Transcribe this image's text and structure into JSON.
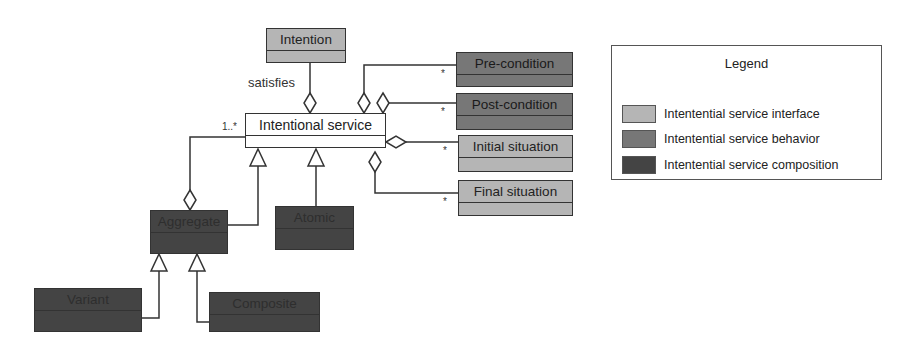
{
  "colors": {
    "interface": "#b5b5b5",
    "behavior": "#777777",
    "composition": "#444444",
    "line": "#333333"
  },
  "classes": {
    "intention": "Intention",
    "intentional_service": "Intentional service",
    "pre_condition": "Pre-condition",
    "post_condition": "Post-condition",
    "initial_situation": "Initial situation",
    "final_situation": "Final situation",
    "aggregate": "Aggregate",
    "atomic": "Atomic",
    "variant": "Variant",
    "composite": "Composite"
  },
  "relations": {
    "satisfies_label": "satisfies",
    "aggregate_multiplicity": "1..*",
    "pre_condition_multiplicity": "*",
    "post_condition_multiplicity": "*",
    "initial_situation_multiplicity": "*",
    "final_situation_multiplicity": "*"
  },
  "legend": {
    "title": "Legend",
    "items": [
      {
        "label": "Intentential service interface",
        "color": "#b5b5b5"
      },
      {
        "label": "Intentential service behavior",
        "color": "#777777"
      },
      {
        "label": "Intentential service composition",
        "color": "#444444"
      }
    ]
  }
}
